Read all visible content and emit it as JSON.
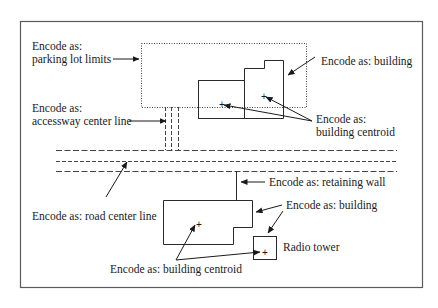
{
  "diagram": {
    "labels": {
      "parking_lot_limits": [
        "Encode as:",
        "parking lot limits"
      ],
      "accessway_center_line": [
        "Encode as:",
        "accessway center line"
      ],
      "building_top": "Encode as: building",
      "building_centroid_top": [
        "Encode as:",
        "building centroid"
      ],
      "road_center_line": "Encode as: road center line",
      "retaining_wall": "Encode as: retaining wall",
      "building_bottom": "Encode as: building",
      "radio_tower": "Radio tower",
      "building_centroid_bottom": "Encode as: building centroid"
    },
    "centroid_marker": "+",
    "colors": {
      "ink": "#1a1a1a",
      "frame": "#555555",
      "background": "#ffffff"
    }
  }
}
